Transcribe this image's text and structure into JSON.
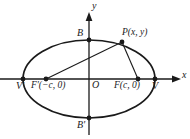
{
  "figure": {
    "type": "ellipse-with-foci-diagram",
    "background_color": "#ffffff",
    "stroke_color": "#1a1a1a"
  },
  "axes": {
    "x_label": "x",
    "y_label": "y",
    "origin_label": "O"
  },
  "points": {
    "vertex_left": "V'",
    "vertex_right": "V",
    "focus_left": "F'(−c, 0)",
    "focus_right": "F(c, 0)",
    "covertex_top": "B",
    "covertex_bottom": "B'",
    "point_p": "P(x, y)"
  },
  "geometry": {
    "center_x": 89,
    "center_y": 79,
    "semi_major": 66,
    "semi_minor": 39,
    "focus_left_x": 46,
    "focus_right_x": 138,
    "vertex_left_x": 23,
    "vertex_right_x": 155,
    "covertex_top_y": 40,
    "covertex_bottom_y": 118,
    "p_x": 122,
    "p_y": 42
  }
}
